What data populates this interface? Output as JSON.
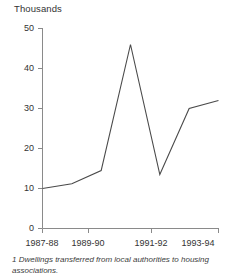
{
  "chart_data": {
    "type": "line",
    "title": "",
    "unit_label": "Thousands",
    "xlabel": "",
    "ylabel": "Thousands",
    "grid": false,
    "legend": "none",
    "x": [
      "1987-88",
      "1988-89",
      "1989-90",
      "1990-91",
      "1991-92",
      "1992-93",
      "1993-94"
    ],
    "categories": [
      "1987-88",
      "1988-89",
      "1989-90",
      "1990-91",
      "1991-92",
      "1992-93",
      "1993-94"
    ],
    "values": [
      10,
      11.2,
      14.5,
      46,
      13.5,
      30,
      32
    ],
    "series": [
      {
        "name": "Dwellings transferred",
        "values": [
          10,
          11.2,
          14.5,
          46,
          13.5,
          30,
          32
        ]
      }
    ],
    "ylim": [
      0,
      50
    ],
    "yticks": [
      0,
      10,
      20,
      30,
      40,
      50
    ],
    "ytick_labels": [
      "0",
      "10",
      "20",
      "30",
      "40",
      "50"
    ],
    "xticks": [
      "1987-88",
      "1989-90",
      "1991-92",
      "1993-94"
    ],
    "xtick_labels": [
      "1987-88",
      "1989-90",
      "1991-92",
      "1993-94"
    ],
    "line_color": "#4a4a4a",
    "axis_color": "#8a8a8a",
    "text_color": "#333333"
  },
  "footnote": {
    "marker": "1",
    "text": "Dwellings transferred from local authorities to housing associations."
  }
}
